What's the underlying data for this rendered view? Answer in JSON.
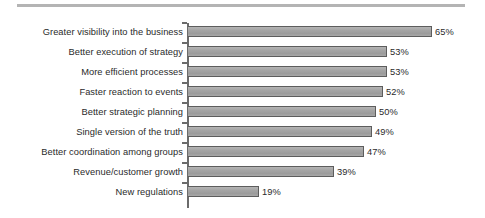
{
  "chart_data": {
    "type": "bar",
    "orientation": "horizontal",
    "title": "",
    "subtitle": "",
    "xlabel": "",
    "ylabel": "",
    "xlim": [
      0,
      70
    ],
    "grid": false,
    "legend": null,
    "value_suffix": "%",
    "categories": [
      "Greater visibility into the business",
      "Better execution of strategy",
      "More efficient processes",
      "Faster reaction to events",
      "Better strategic planning",
      "Single version of the truth",
      "Better coordination among groups",
      "Revenue/customer growth",
      "New regulations"
    ],
    "values": [
      65,
      53,
      53,
      52,
      50,
      49,
      47,
      39,
      19
    ],
    "value_labels": [
      "65%",
      "53%",
      "53%",
      "52%",
      "50%",
      "49%",
      "47%",
      "39%",
      "19%"
    ],
    "colors": {
      "bar_fill": "#a3a3a3",
      "bar_border": "#5d5d5d",
      "axis": "#6b6b6b",
      "text": "#2a2a2a",
      "background": "#ffffff",
      "scan_rule": "#9b9b9b"
    },
    "pixels_per_unit": 3.75
  }
}
